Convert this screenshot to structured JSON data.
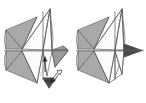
{
  "figure": {
    "type": "instructional-line-diagram",
    "panel_count": 2,
    "background_color": "#ffffff",
    "line_color": "#5a5a5a",
    "paper_front_color": "#fcfcfc",
    "paper_shaded_color": "#a9a9a9",
    "paper_dark_color": "#4a4a4a",
    "dash_color": "#7a7a7a",
    "arrow_color": "#2b2b2b"
  },
  "panels": [
    {
      "id": "left-step",
      "label": "before-fold",
      "caption": "",
      "has_action_arrows": true,
      "arrows": [
        {
          "name": "valley-fold-arrow",
          "style": "dashed-curved-with-solid-head",
          "direction": "up",
          "meaning": "fold edge upward"
        },
        {
          "name": "push-in-arrow",
          "style": "hollow-outline",
          "direction": "up-left",
          "meaning": "push / inside reverse fold"
        },
        {
          "name": "pull-flap-arrow",
          "style": "solid-short",
          "direction": "right",
          "meaning": "pull flap to the right"
        }
      ]
    },
    {
      "id": "right-step",
      "label": "after-fold",
      "caption": "",
      "has_action_arrows": true,
      "arrows": [
        {
          "name": "result-point-arrow",
          "style": "solid-filled-triangle",
          "direction": "right",
          "meaning": "resulting point extends right"
        }
      ]
    }
  ]
}
